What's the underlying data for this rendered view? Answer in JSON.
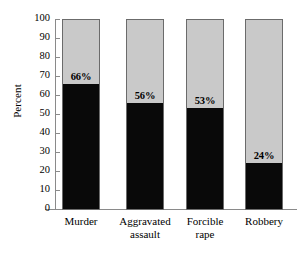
{
  "chart_data": {
    "type": "bar",
    "subtype": "stacked-100-percent",
    "title": "Relation to Victim",
    "title_cropped": true,
    "xlabel": "",
    "ylabel": "Percent",
    "ylim": [
      0,
      100
    ],
    "ytick_step": 10,
    "yticks": [
      100,
      90,
      80,
      70,
      60,
      50,
      40,
      30,
      20,
      10,
      0
    ],
    "grid": false,
    "legend": "none",
    "categories": [
      "Murder",
      "Aggravated assault",
      "Forcible rape",
      "Robbery"
    ],
    "series": [
      {
        "name": "Known to victim",
        "color": "#090909",
        "values": [
          66,
          56,
          53,
          24
        ],
        "labels": [
          "66%",
          "56%",
          "53%",
          "24%"
        ]
      },
      {
        "name": "Stranger",
        "color": "#c9c9c9",
        "values": [
          34,
          44,
          47,
          76
        ],
        "labels": [
          "",
          "",
          "",
          ""
        ]
      }
    ]
  },
  "axis": {
    "y_title": "Percent",
    "tick_labels": [
      "100",
      "90",
      "80",
      "70",
      "60",
      "50",
      "40",
      "30",
      "20",
      "10",
      "0"
    ]
  },
  "categories_display": [
    {
      "line1": "Murder",
      "line2": ""
    },
    {
      "line1": "Aggravated",
      "line2": "assault"
    },
    {
      "line1": "Forcible",
      "line2": "rape"
    },
    {
      "line1": "Robbery",
      "line2": ""
    }
  ],
  "colors": {
    "dark_segment": "#090909",
    "light_segment": "#c9c9c9",
    "bar_outline": "#6b6b6b",
    "axis": "#8a8a8a",
    "background": "#ffffff",
    "text": "#000000"
  }
}
